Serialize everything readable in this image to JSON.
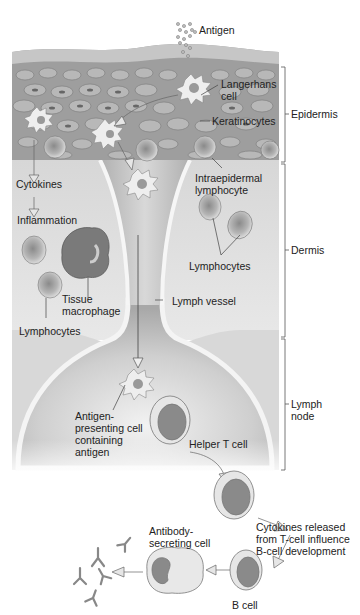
{
  "diagram": {
    "regions": [
      {
        "label": "Epidermis",
        "bracket_top": 67,
        "bracket_bottom": 162
      },
      {
        "label": "Dermis",
        "bracket_top": 163,
        "bracket_bottom": 337
      },
      {
        "label": "Lymph\nnode",
        "bracket_top": 338,
        "bracket_bottom": 470
      }
    ],
    "labels": {
      "antigen": "Antigen",
      "langerhans": "Langerhans\ncell",
      "keratinocytes": "Keratinocytes",
      "intraepidermal": "Intraepidermal\nlymphocyte",
      "cytokines": "Cytokines",
      "inflammation": "Inflammation",
      "lymphocytes_right": "Lymphocytes",
      "tissue_macrophage": "Tissue\nmacrophage",
      "lymph_vessel": "Lymph vessel",
      "lymphocytes_left": "Lymphocytes",
      "apc": "Antigen-\npresenting cell\ncontaining\nantigen",
      "helper_t": "Helper T cell",
      "cytokines_released": "Cytokines released\nfrom T-cell influence\nB-cell development",
      "antibody_secreting": "Antibody-\nsecreting cell",
      "b_cell": "B cell"
    },
    "colors": {
      "epidermis": "#9a9a9a",
      "dermis": "#dcdcdc",
      "node": "#c4c4c4",
      "stroke": "#555555"
    }
  }
}
